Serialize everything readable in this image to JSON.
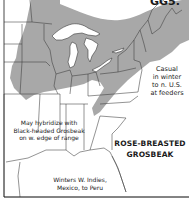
{
  "map": {
    "species": "ROSE-BREASTED GROSBEAK",
    "title_line1": "ROSE-BREASTED",
    "title_line2": "GROSBEAK",
    "corner_text": "GG5.",
    "legend": {
      "breeding_range_color": "#a8a8a8",
      "background_color": "#ffffff",
      "boundary_color": "#3a3a3a"
    },
    "annotations": {
      "casual": {
        "line1": "Casual",
        "line2": "in winter",
        "line3": "to n. U.S.",
        "line4": "at feeders"
      },
      "hybrid": {
        "line1": "May hybridize with",
        "line2": "Black-headed Grosbeak",
        "line3": "on w. edge of range"
      },
      "winter": {
        "line1": "Winters W. Indies,",
        "line2": "Mexico, to Peru"
      }
    }
  }
}
